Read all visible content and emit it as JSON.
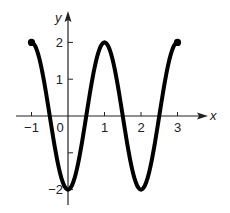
{
  "chart_data": {
    "type": "line",
    "title": "",
    "xlabel": "x",
    "ylabel": "y",
    "function": "y = -2cos(pi x)",
    "domain": [
      -1,
      3
    ],
    "xlim": [
      -1.3,
      3.6
    ],
    "ylim": [
      -2.5,
      2.55
    ],
    "grid": false,
    "legend": null,
    "x_ticks": [
      -1,
      0,
      1,
      2,
      3
    ],
    "x_tick_labels": [
      "−1",
      "0",
      "1",
      "2",
      "3"
    ],
    "y_ticks": [
      2,
      1,
      -1,
      -2
    ],
    "y_tick_labels": [
      "2",
      "1",
      "",
      "−2"
    ],
    "key_points": [
      {
        "x": -1,
        "y": 2
      },
      {
        "x": -0.5,
        "y": 0
      },
      {
        "x": 0,
        "y": -2
      },
      {
        "x": 0.5,
        "y": 0
      },
      {
        "x": 1,
        "y": 2
      },
      {
        "x": 1.5,
        "y": 0
      },
      {
        "x": 2,
        "y": -2
      },
      {
        "x": 2.5,
        "y": 0
      },
      {
        "x": 3,
        "y": 2
      }
    ],
    "endpoints": [
      {
        "x": -1,
        "y": 2,
        "style": "closed"
      },
      {
        "x": 3,
        "y": 2,
        "style": "closed"
      }
    ],
    "colors": {
      "curve": "#000000",
      "axes": "#222222",
      "text": "#222222"
    }
  }
}
